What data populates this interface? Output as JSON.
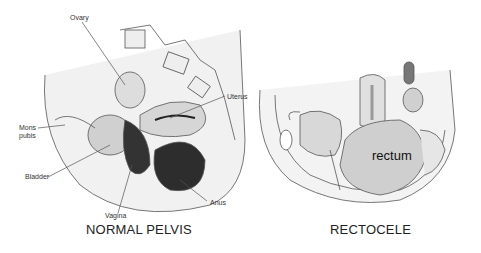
{
  "diagrams": [
    {
      "id": "normal",
      "title": "NORMAL PELVIS",
      "labels": [
        {
          "key": "ovary",
          "text": "Ovary"
        },
        {
          "key": "uterus",
          "text": "Uterus"
        },
        {
          "key": "mons_pubis",
          "text": "Mons\npubis"
        },
        {
          "key": "bladder",
          "text": "Bladder"
        },
        {
          "key": "vagina",
          "text": "Vagina"
        },
        {
          "key": "anus",
          "text": "Anus"
        }
      ]
    },
    {
      "id": "rectocele",
      "title": "RECTOCELE",
      "labels": [
        {
          "key": "rectum",
          "text": "rectum"
        }
      ]
    }
  ],
  "colors": {
    "background": "#ffffff",
    "line": "#555555",
    "tissue_light": "#e6e6e6",
    "tissue_mid": "#bdbdbd",
    "tissue_dark": "#2a2a2a"
  }
}
